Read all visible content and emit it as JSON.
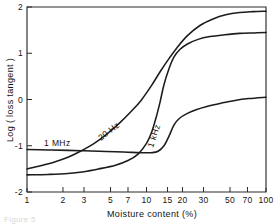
{
  "figure": {
    "caption": "Figure 5",
    "background_color": "#ffffff",
    "line_color": "#1c1c1c",
    "axis_color": "#2b2b2b"
  },
  "chart_data": {
    "type": "line",
    "title": "",
    "xlabel": "Moisture content  (%)",
    "ylabel": "Log ( loss tangent )",
    "xscale": "log",
    "yscale": "linear",
    "xlim": [
      1,
      100
    ],
    "ylim": [
      -2,
      2
    ],
    "grid": false,
    "legend": "inline-curve-labels",
    "xticks": [
      1,
      2,
      3,
      5,
      7,
      10,
      15,
      20,
      30,
      50,
      70,
      100
    ],
    "xticklabels": [
      "1",
      "2",
      "3",
      "5",
      "7",
      "10",
      "15",
      "20",
      "30",
      "50",
      "70",
      "100"
    ],
    "yticks": [
      -2,
      -1,
      0,
      1,
      2
    ],
    "yticklabels": [
      "-2",
      "-1",
      "0",
      "1",
      "2"
    ],
    "series": [
      {
        "name": "20 Hz",
        "label": "20 Hz",
        "label_rotation_deg": -38,
        "x": [
          1,
          1.3,
          1.7,
          2.2,
          2.8,
          3.6,
          4.6,
          6,
          7.5,
          9,
          11,
          13,
          15,
          18,
          22,
          28,
          36,
          46,
          60,
          78,
          100
        ],
        "y": [
          -1.5,
          -1.43,
          -1.35,
          -1.25,
          -1.12,
          -0.96,
          -0.76,
          -0.5,
          -0.25,
          -0.02,
          0.3,
          0.6,
          0.84,
          1.12,
          1.38,
          1.6,
          1.74,
          1.83,
          1.88,
          1.9,
          1.91
        ]
      },
      {
        "name": "1 kHz",
        "label": "1 kHz",
        "label_rotation_deg": -72,
        "x": [
          1,
          1.5,
          2.2,
          3,
          4,
          5.5,
          7,
          8.5,
          10,
          11,
          12,
          13,
          14,
          15.5,
          17,
          19,
          22,
          27,
          34,
          45,
          60,
          80,
          100
        ],
        "y": [
          -1.63,
          -1.62,
          -1.6,
          -1.56,
          -1.5,
          -1.42,
          -1.32,
          -1.18,
          -0.95,
          -0.72,
          -0.4,
          -0.05,
          0.32,
          0.68,
          0.92,
          1.08,
          1.2,
          1.3,
          1.36,
          1.4,
          1.43,
          1.44,
          1.45
        ]
      },
      {
        "name": "1 MHz",
        "label": "1 MHz",
        "label_rotation_deg": 0,
        "x": [
          1,
          1.5,
          2.2,
          3,
          4,
          5.5,
          7,
          9,
          11,
          12.5,
          14,
          15.5,
          17,
          19,
          22,
          26,
          32,
          42,
          55,
          72,
          100
        ],
        "y": [
          -1.08,
          -1.09,
          -1.1,
          -1.11,
          -1.12,
          -1.13,
          -1.14,
          -1.15,
          -1.15,
          -1.12,
          -1.0,
          -0.78,
          -0.55,
          -0.4,
          -0.3,
          -0.22,
          -0.15,
          -0.08,
          -0.02,
          0.02,
          0.05
        ]
      }
    ]
  }
}
